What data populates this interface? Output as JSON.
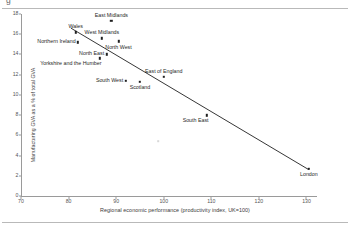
{
  "figure": {
    "top_title_partial": "g",
    "has_top_rule": true,
    "has_bottom_rule": true
  },
  "chart_data": {
    "type": "scatter",
    "title": "",
    "xlabel": "Regional economic performance (productivity index, UK=100)",
    "ylabel": "Manufacturing GVA as a % of total GVA",
    "xlim": [
      70,
      132
    ],
    "ylim": [
      0,
      18
    ],
    "xticks": [
      70,
      80,
      90,
      100,
      110,
      120,
      130
    ],
    "yticks": [
      0,
      2,
      4,
      6,
      8,
      10,
      12,
      14,
      16,
      18
    ],
    "grid": false,
    "legend": "none",
    "points": [
      {
        "label": "East Midlands",
        "x": 89.0,
        "y": 17.3,
        "label_pos": "above"
      },
      {
        "label": "Wales",
        "x": 81.5,
        "y": 16.2,
        "label_pos": "above"
      },
      {
        "label": "West Midlands",
        "x": 87.0,
        "y": 15.6,
        "label_pos": "above"
      },
      {
        "label": "Northern Ireland",
        "x": 82.0,
        "y": 15.2,
        "label_pos": "left"
      },
      {
        "label": "North West",
        "x": 90.5,
        "y": 15.3,
        "label_pos": "below"
      },
      {
        "label": "North East",
        "x": 88.0,
        "y": 14.0,
        "label_pos": "left"
      },
      {
        "label": "Yorkshire and the Humber",
        "x": 86.5,
        "y": 13.6,
        "label_pos": "below-left"
      },
      {
        "label": "East of England",
        "x": 100.0,
        "y": 11.8,
        "label_pos": "above"
      },
      {
        "label": "South West",
        "x": 92.0,
        "y": 11.4,
        "label_pos": "left"
      },
      {
        "label": "Scotland",
        "x": 95.0,
        "y": 11.3,
        "label_pos": "below"
      },
      {
        "label": "South East",
        "x": 109.0,
        "y": 8.0,
        "label_pos": "below-left"
      },
      {
        "label": "London",
        "x": 130.5,
        "y": 2.7,
        "label_pos": "below"
      }
    ],
    "trendline": {
      "type": "linear",
      "x_start": 80.5,
      "y_start": 16.6,
      "x_end": 130.5,
      "y_end": 2.6
    }
  }
}
